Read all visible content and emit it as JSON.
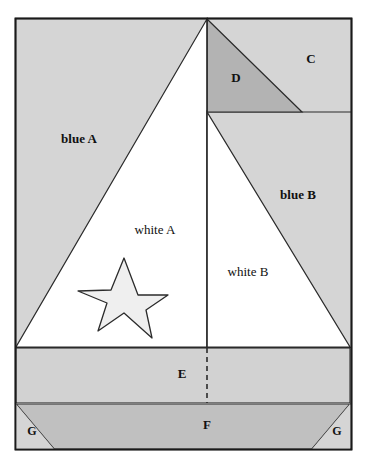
{
  "figure": {
    "width": 367,
    "height": 466,
    "background_color": "#ffffff",
    "border_color": "#1a1a1a",
    "stroke_color": "#2b2b2b"
  },
  "colors": {
    "sky_light_gray": "#d5d5d5",
    "sail_white": "#ffffff",
    "triangle_d_dark_gray": "#b3b3b3",
    "band_e_gray": "#d2d2d2",
    "hull_f_gray": "#c0c0c0",
    "star_fill": "#efefef",
    "outline": "#2b2b2b"
  },
  "labels": [
    {
      "id": "blue-a",
      "text": "blue A",
      "x": 79,
      "y": 140,
      "size": 13,
      "weight": "bold"
    },
    {
      "id": "blue-b",
      "text": "blue B",
      "x": 298,
      "y": 196,
      "size": 13,
      "weight": "bold"
    },
    {
      "id": "white-a",
      "text": "white A",
      "x": 155,
      "y": 231,
      "size": 13,
      "weight": "normal"
    },
    {
      "id": "white-b",
      "text": "white B",
      "x": 248,
      "y": 273,
      "size": 13,
      "weight": "normal"
    },
    {
      "id": "region-c",
      "text": "C",
      "x": 311,
      "y": 60,
      "size": 13,
      "weight": "bold"
    },
    {
      "id": "region-d",
      "text": "D",
      "x": 236,
      "y": 79,
      "size": 13,
      "weight": "bold"
    },
    {
      "id": "region-e",
      "text": "E",
      "x": 182,
      "y": 375,
      "size": 13,
      "weight": "bold"
    },
    {
      "id": "region-f",
      "text": "F",
      "x": 207,
      "y": 426,
      "size": 13,
      "weight": "bold"
    },
    {
      "id": "region-g-left",
      "text": "G",
      "x": 32,
      "y": 432,
      "size": 12,
      "weight": "bold"
    },
    {
      "id": "region-g-right",
      "text": "G",
      "x": 337,
      "y": 432,
      "size": 12,
      "weight": "bold"
    }
  ],
  "geometry": {
    "outer_border": {
      "x": 15,
      "y": 18,
      "width": 337,
      "height": 432
    },
    "mast_x": 207,
    "apex": {
      "x": 207,
      "y": 19
    },
    "deck_y": 347,
    "sail_a": "207,19 16,347 207,347",
    "sail_b": "207,112 207,347 350,347",
    "triangle_d": "207,19 207,112 302,112",
    "band_e": {
      "x": 16,
      "y": 348,
      "width": 334,
      "height": 55
    },
    "hull_f": "16,404 350,404 312,449 54,449",
    "corner_g_left": "16,404 54,449 16,449",
    "corner_g_right": "350,404 350,449 312,449",
    "dashed_mast_line": {
      "x": 207,
      "y1": 348,
      "y2": 403
    },
    "star_points": "124,258 138,295 168,295 146,310 152,338 124,313 98,331 107,303 78,291 111,290",
    "region_line_cd_y": 112
  },
  "legend_note": {
    "regions": [
      "blue A",
      "blue B",
      "white A",
      "white B",
      "C",
      "D",
      "E",
      "F",
      "G"
    ]
  }
}
